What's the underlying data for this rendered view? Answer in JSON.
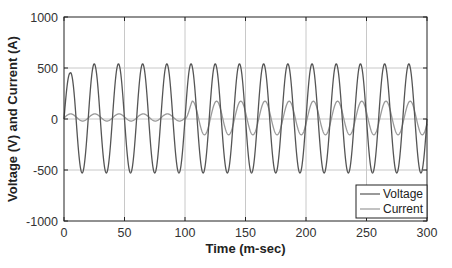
{
  "chart_data": {
    "type": "line",
    "title": "",
    "xlabel": "Time (m-sec)",
    "ylabel": "Voltage (V) and Current (A)",
    "xlim": [
      0,
      300
    ],
    "ylim": [
      -1000,
      1000
    ],
    "xticks": [
      0,
      50,
      100,
      150,
      200,
      250,
      300
    ],
    "yticks": [
      -1000,
      -500,
      0,
      500,
      1000
    ],
    "xtick_labels": [
      "0",
      "50",
      "100",
      "150",
      "200",
      "250",
      "300"
    ],
    "ytick_labels": [
      "-1000",
      "-500",
      "0",
      "500",
      "1000"
    ],
    "grid": true,
    "legend_position": "lower right",
    "series": [
      {
        "name": "Voltage",
        "color": "#555555",
        "frequency_hz": 50,
        "amplitude": 540,
        "first_peak": 450,
        "peak_times_ms": [
          5,
          25,
          45,
          65,
          85,
          105,
          125,
          145,
          165,
          185,
          205,
          225,
          245,
          265,
          285
        ],
        "description": "50 Hz sinusoid, ~540 V peak, ~-530 V trough; first peak slightly lower (~450 V)"
      },
      {
        "name": "Current",
        "color": "#9a9a9a",
        "frequency_hz": 50,
        "segments": [
          {
            "t_range_ms": [
              0,
              100
            ],
            "amplitude": 35,
            "offset": 15,
            "description": "small current ~ +50 / -20 A"
          },
          {
            "t_range_ms": [
              100,
              300
            ],
            "amplitude": 165,
            "offset": 10,
            "description": "after step at 100 ms: ~ +175 / -155 A"
          }
        ]
      }
    ]
  },
  "legend": {
    "items": [
      {
        "label": "Voltage",
        "color": "#555555"
      },
      {
        "label": "Current",
        "color": "#9a9a9a"
      }
    ]
  },
  "axes": {
    "xlabel": "Time (m-sec)",
    "ylabel": "Voltage (V) and Current (A)"
  }
}
